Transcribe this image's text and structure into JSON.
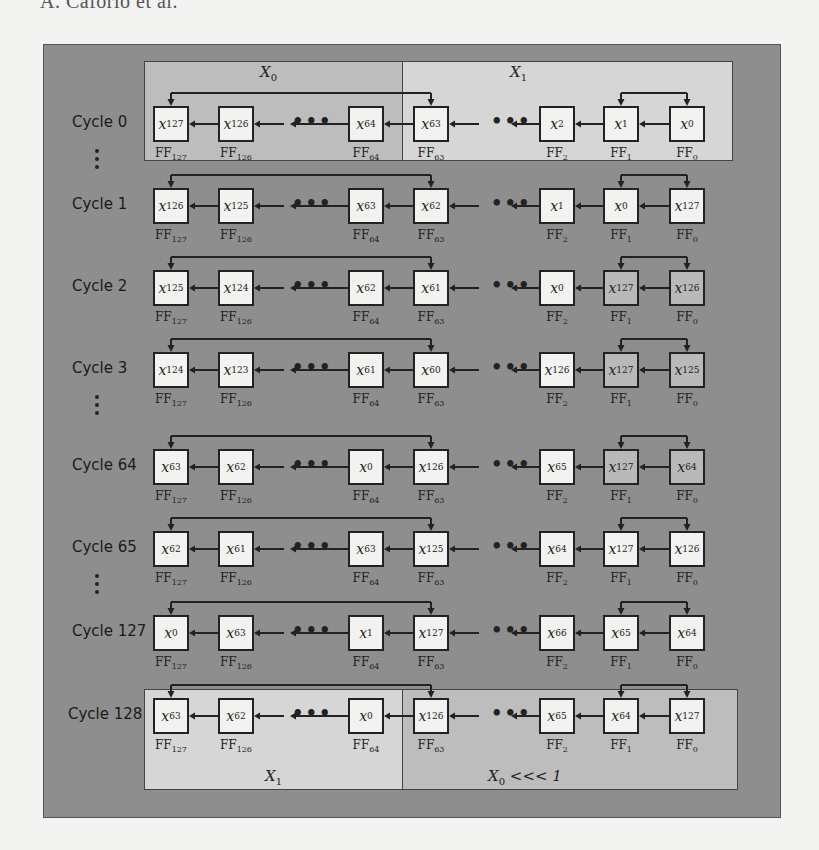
{
  "page": {
    "running_head": "A. Caforio et al."
  },
  "colors": {
    "panel_bg": "#8e8e8e",
    "region_x0_top": "#bdbdbd",
    "region_x1_top": "#d6d6d6",
    "region_x1_bottom": "#d6d6d6",
    "region_x0rot_bottom": "#bdbdbd",
    "ff_default": "#f2f2f0",
    "ff_shaded": "#b9b9b9"
  },
  "regions": {
    "top_left": {
      "name": "X",
      "sub": "0"
    },
    "top_right": {
      "name": "X",
      "sub": "1"
    },
    "bottom_left": {
      "name": "X",
      "sub": "1"
    },
    "bottom_right": {
      "name": "X",
      "sub": "0",
      "suffix": " <<< 1"
    }
  },
  "columns": [
    "127",
    "126",
    "64",
    "63",
    "2",
    "1",
    "0"
  ],
  "column_label_prefix": "FF",
  "ellipsis": "•••",
  "rows": [
    {
      "label": "Cycle 0",
      "cells": [
        "127",
        "126",
        "64",
        "63",
        "2",
        "1",
        "0"
      ],
      "shaded": [
        false,
        false,
        false,
        false,
        false,
        false,
        false
      ],
      "dots_after": true
    },
    {
      "label": "Cycle 1",
      "cells": [
        "126",
        "125",
        "63",
        "62",
        "1",
        "0",
        "127"
      ],
      "shaded": [
        false,
        false,
        false,
        false,
        false,
        false,
        false
      ],
      "dots_after": false
    },
    {
      "label": "Cycle 2",
      "cells": [
        "125",
        "124",
        "62",
        "61",
        "0",
        "127",
        "126"
      ],
      "shaded": [
        false,
        false,
        false,
        false,
        false,
        true,
        true
      ],
      "dots_after": false
    },
    {
      "label": "Cycle 3",
      "cells": [
        "124",
        "123",
        "61",
        "60",
        "126",
        "127",
        "125"
      ],
      "shaded": [
        false,
        false,
        false,
        false,
        false,
        true,
        true
      ],
      "dots_after": true
    },
    {
      "label": "Cycle 64",
      "cells": [
        "63",
        "62",
        "0",
        "126",
        "65",
        "127",
        "64"
      ],
      "shaded": [
        false,
        false,
        false,
        false,
        false,
        true,
        true
      ],
      "dots_after": false
    },
    {
      "label": "Cycle 65",
      "cells": [
        "62",
        "61",
        "63",
        "125",
        "64",
        "127",
        "126"
      ],
      "shaded": [
        false,
        false,
        false,
        false,
        false,
        false,
        false
      ],
      "dots_after": true
    },
    {
      "label": "Cycle 127",
      "cells": [
        "0",
        "63",
        "1",
        "127",
        "66",
        "65",
        "64"
      ],
      "shaded": [
        false,
        false,
        false,
        false,
        false,
        false,
        false
      ],
      "dots_after": false
    },
    {
      "label": "Cycle 128",
      "cells": [
        "63",
        "62",
        "0",
        "126",
        "65",
        "64",
        "127"
      ],
      "shaded": [
        false,
        false,
        false,
        false,
        false,
        false,
        false
      ],
      "dots_after": false
    }
  ]
}
